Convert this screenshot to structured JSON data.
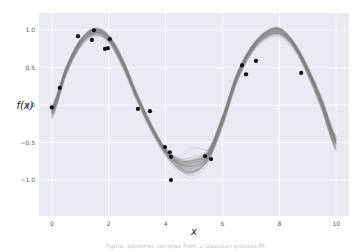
{
  "chart_data": {
    "type": "line",
    "title": "",
    "xlabel": "x",
    "ylabel": "f(x)",
    "xlim": [
      -0.45,
      10.45
    ],
    "ylim": [
      -1.48,
      1.23
    ],
    "xticks": [
      0,
      2,
      4,
      6,
      8,
      10
    ],
    "xtick_labels": [
      "0",
      "2",
      "4",
      "6",
      "8",
      "10"
    ],
    "yticks": [
      1.0,
      0.5,
      0.0,
      -0.5,
      -1.0
    ],
    "ytick_labels": [
      "1.0",
      "0.5",
      "0.0",
      "−0.5",
      "−1.0"
    ],
    "grid": true,
    "style": "seaborn-darkgrid",
    "legend": null,
    "posterior_mean": {
      "name": "posterior samples (mean shape)",
      "x": [
        0,
        0.5,
        1.0,
        1.5,
        2.0,
        2.5,
        3.0,
        3.5,
        4.0,
        4.5,
        5.0,
        5.5,
        6.0,
        6.5,
        7.0,
        7.5,
        8.0,
        8.5,
        9.0,
        9.5,
        10.0
      ],
      "y": [
        -0.1,
        0.45,
        0.82,
        0.97,
        0.88,
        0.55,
        0.1,
        -0.3,
        -0.62,
        -0.8,
        -0.82,
        -0.68,
        -0.22,
        0.35,
        0.72,
        0.92,
        0.97,
        0.8,
        0.45,
        0.0,
        -0.52
      ],
      "band_halfwidth": [
        0.1,
        0.07,
        0.07,
        0.07,
        0.07,
        0.08,
        0.07,
        0.07,
        0.07,
        0.12,
        0.16,
        0.1,
        0.09,
        0.08,
        0.07,
        0.08,
        0.09,
        0.07,
        0.08,
        0.1,
        0.13
      ],
      "color": "#7a7a7a"
    },
    "observations": {
      "name": "data points",
      "color": "#111111",
      "x": [
        0.0,
        0.28,
        0.92,
        1.41,
        1.48,
        1.87,
        1.97,
        2.04,
        3.03,
        3.45,
        3.98,
        4.15,
        4.19,
        4.19,
        5.39,
        5.6,
        6.69,
        6.83,
        7.18,
        8.77
      ],
      "y": [
        -0.03,
        0.23,
        0.92,
        0.87,
        1.0,
        0.75,
        0.76,
        0.88,
        -0.05,
        -0.08,
        -0.56,
        -0.63,
        -0.69,
        -1.0,
        -0.68,
        -0.72,
        0.53,
        0.41,
        0.59,
        0.43
      ]
    }
  },
  "caption": {
    "text": "Figure: posterior samples from a Gaussian process fit"
  },
  "colors": {
    "plot_background": "#eaeaf2",
    "grid": "#ffffff",
    "sample_curves": "#808080",
    "points": "#111111"
  }
}
